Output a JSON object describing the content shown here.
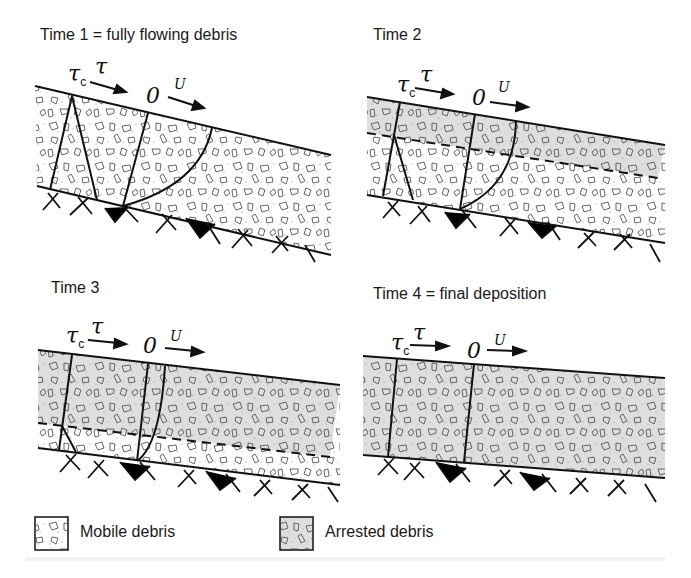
{
  "figure": {
    "panels": [
      {
        "id": "time1",
        "title": "Time 1 = fully flowing debris",
        "tau_c": "τ",
        "tau_c_sub": "c",
        "tau": "τ",
        "zero": "0",
        "velocity": "U",
        "state": "fully mobile"
      },
      {
        "id": "time2",
        "title": "Time 2",
        "tau_c": "τ",
        "tau_c_sub": "c",
        "tau": "τ",
        "zero": "0",
        "velocity": "U",
        "state": "upper layer arrested, lower mobile"
      },
      {
        "id": "time3",
        "title": "Time 3",
        "tau_c": "τ",
        "tau_c_sub": "c",
        "tau": "τ",
        "zero": "0",
        "velocity": "U",
        "state": "thin basal mobile layer"
      },
      {
        "id": "time4",
        "title": "Time 4 = final deposition",
        "tau_c": "τ",
        "tau_c_sub": "c",
        "tau": "τ",
        "zero": "0",
        "velocity": "U",
        "state": "fully arrested"
      }
    ],
    "legend": [
      {
        "label": "Mobile debris",
        "fill": "#ffffff"
      },
      {
        "label": "Arrested debris",
        "fill": "#dedede"
      }
    ],
    "colors": {
      "line": "#111111",
      "mobile_fill": "#ffffff",
      "arrested_fill": "#dedede",
      "clast_stroke": "#555555"
    }
  }
}
